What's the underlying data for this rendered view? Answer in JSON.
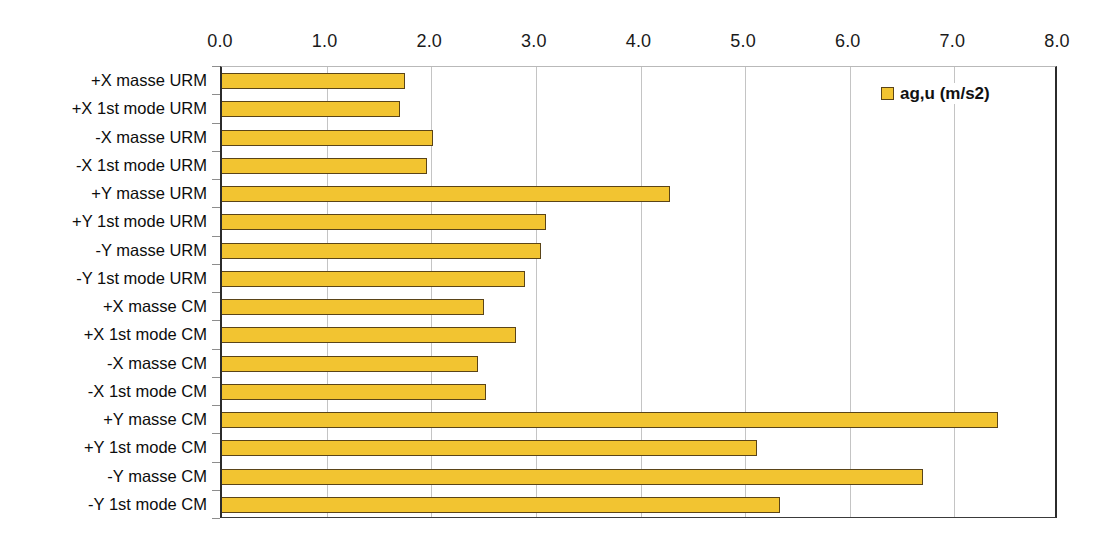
{
  "chart_data": {
    "type": "bar",
    "orientation": "horizontal",
    "title": "",
    "xlabel": "",
    "ylabel": "",
    "xlim": [
      0.0,
      8.0
    ],
    "xticks": [
      "0.0",
      "1.0",
      "2.0",
      "3.0",
      "4.0",
      "5.0",
      "6.0",
      "7.0",
      "8.0"
    ],
    "xtick_values": [
      0.0,
      1.0,
      2.0,
      3.0,
      4.0,
      5.0,
      6.0,
      7.0,
      8.0
    ],
    "grid": "vertical",
    "legend_position": "top-right",
    "legend": [
      "ag,u (m/s2)"
    ],
    "categories": [
      "+X masse URM",
      "+X 1st mode URM",
      "-X masse URM",
      "-X 1st mode URM",
      "+Y masse URM",
      "+Y 1st mode URM",
      "-Y masse URM",
      "-Y 1st mode URM",
      "+X masse CM",
      "+X 1st mode CM",
      "-X masse CM",
      "-X 1st mode CM",
      "+Y masse CM",
      "+Y 1st mode CM",
      "-Y masse CM",
      "-Y 1st mode CM"
    ],
    "series": [
      {
        "name": "ag,u (m/s2)",
        "color": "#f2c431",
        "border_color": "#5a4418",
        "values": [
          1.75,
          1.7,
          2.02,
          1.96,
          4.28,
          3.1,
          3.05,
          2.9,
          2.5,
          2.81,
          2.45,
          2.52,
          7.42,
          5.11,
          6.7,
          5.33
        ]
      }
    ]
  },
  "colors": {
    "bar_fill": "#f2c431",
    "bar_border": "#5a4418",
    "gridline": "#c4c4c4",
    "axis": "#2b2b2b",
    "background": "#ffffff"
  }
}
